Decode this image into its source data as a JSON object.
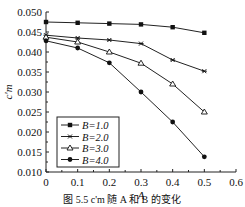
{
  "chart_data": {
    "type": "line",
    "title": "",
    "xlabel": "A",
    "ylabel": "c'_m",
    "xlim": [
      0,
      0.6
    ],
    "ylim": [
      0.01,
      0.05
    ],
    "x_ticks": [
      "0",
      "0.1",
      "0.2",
      "0.3",
      "0.4",
      "0.5",
      "0.6"
    ],
    "y_ticks": [
      "0.010",
      "0.015",
      "0.020",
      "0.025",
      "0.030",
      "0.035",
      "0.040",
      "0.045",
      "0.050"
    ],
    "grid": false,
    "legend_position": "lower-left",
    "x": [
      0,
      0.1,
      0.2,
      0.3,
      0.4,
      0.5
    ],
    "series": [
      {
        "name": "B=1.0",
        "marker": "square",
        "values": [
          0.0475,
          0.0473,
          0.0471,
          0.0469,
          0.0462,
          0.0448
        ]
      },
      {
        "name": "B=2.0",
        "marker": "star",
        "values": [
          0.0442,
          0.0435,
          0.043,
          0.0421,
          0.038,
          0.0352
        ]
      },
      {
        "name": "B=3.0",
        "marker": "triangle",
        "values": [
          0.0437,
          0.0425,
          0.04,
          0.0372,
          0.032,
          0.025
        ]
      },
      {
        "name": "B=4.0",
        "marker": "circle",
        "values": [
          0.0428,
          0.041,
          0.0373,
          0.03,
          0.0225,
          0.0138
        ]
      }
    ]
  },
  "caption": "图 5.5  c'm 随 A 和 B 的变化"
}
